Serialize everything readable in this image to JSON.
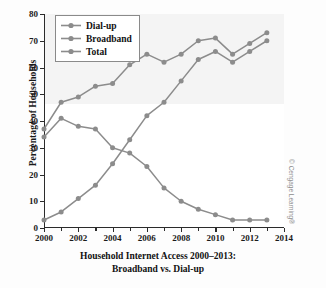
{
  "chart_data": {
    "type": "line",
    "title": "Household Internet Access 2000–2013: Broadband vs. Dial-up",
    "title_line1": "Household Internet Access 2000–2013:",
    "title_line2": "Broadband vs. Dial-up",
    "xlabel": "",
    "ylabel": "Percentage of Households",
    "x": [
      2000,
      2001,
      2002,
      2003,
      2004,
      2005,
      2006,
      2007,
      2008,
      2009,
      2010,
      2011,
      2012,
      2013
    ],
    "xlim": [
      2000,
      2014
    ],
    "ylim": [
      0,
      80
    ],
    "x_ticks": [
      2000,
      2002,
      2004,
      2006,
      2008,
      2010,
      2012,
      2014
    ],
    "x_tick_labels": [
      "2000",
      "2002",
      "2004",
      "2006",
      "2008",
      "2010",
      "2012",
      "2014"
    ],
    "x_minor_ticks": [
      2001,
      2003,
      2005,
      2007,
      2009,
      2011,
      2013
    ],
    "y_ticks": [
      0,
      10,
      20,
      30,
      40,
      50,
      60,
      70,
      80
    ],
    "y_tick_labels": [
      "0",
      "10",
      "20",
      "30",
      "40",
      "50",
      "60",
      "70",
      "80"
    ],
    "grid": false,
    "legend_position": "upper left",
    "series": [
      {
        "name": "Dial-up",
        "values": [
          34,
          41,
          38,
          37,
          30,
          28,
          23,
          15,
          10,
          7,
          5,
          3,
          3,
          3
        ],
        "color": "#8c8c8c"
      },
      {
        "name": "Broadband",
        "values": [
          3,
          6,
          11,
          16,
          24,
          33,
          42,
          47,
          55,
          63,
          66,
          62,
          66,
          70
        ],
        "color": "#8c8c8c"
      },
      {
        "name": "Total",
        "values": [
          37,
          47,
          49,
          53,
          54,
          61,
          65,
          62,
          65,
          70,
          71,
          65,
          69,
          73
        ],
        "color": "#8c8c8c"
      }
    ],
    "annotations": {
      "credit": "© Cengage Learning®"
    }
  },
  "legend": {
    "items": [
      {
        "label": "Dial-up"
      },
      {
        "label": "Broadband"
      },
      {
        "label": "Total"
      }
    ]
  },
  "colors": {
    "series_gray": "#8c8c8c",
    "axis": "#2b2b2b",
    "text": "#111111",
    "credit": "#8d8d8d"
  }
}
